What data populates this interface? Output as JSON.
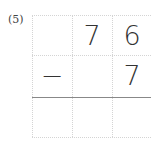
{
  "problem": {
    "label": "(5)",
    "operator": "−",
    "rows": [
      [
        "",
        "7",
        "6"
      ],
      [
        "−",
        "",
        "7"
      ],
      [
        "",
        "",
        ""
      ]
    ]
  },
  "colors": {
    "grid": "#d4d4d4",
    "answer_line": "#888888",
    "text": "#333333"
  }
}
